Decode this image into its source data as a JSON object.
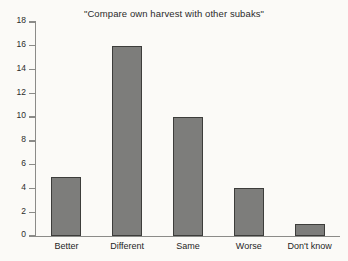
{
  "chart_data": {
    "type": "bar",
    "title": "\"Compare own harvest with other subaks\"",
    "xlabel": "",
    "ylabel": "",
    "categories": [
      "Better",
      "Different",
      "Same",
      "Worse",
      "Don't know"
    ],
    "values": [
      5,
      16,
      10,
      4,
      1
    ],
    "ylim": [
      0,
      18
    ],
    "ytick_step": 2,
    "ytick_labels": [
      "18",
      "16",
      "14",
      "12",
      "10",
      "8",
      "6",
      "4",
      "2",
      "0"
    ],
    "ytick_values": [
      18,
      16,
      14,
      12,
      10,
      8,
      6,
      4,
      2,
      0
    ],
    "grid": false,
    "legend": false,
    "legend_position": "none",
    "colors": {
      "bar_fill": "#7d7d7b",
      "bar_edge": "#3d3d3b",
      "axis": "#8b8b88",
      "text": "#1f1f1f",
      "background": "#fbfaf7"
    }
  }
}
